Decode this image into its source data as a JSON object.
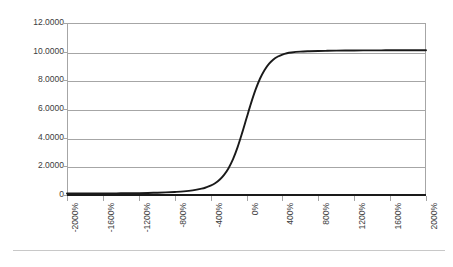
{
  "chart_data": {
    "type": "line",
    "title": "",
    "subtitle": "",
    "xlabel": "",
    "ylabel": "",
    "grid": true,
    "legend": false,
    "legend_position": "none",
    "xlim": [
      -2000,
      2000
    ],
    "ylim": [
      0,
      12
    ],
    "x_tick_labels": [
      "-2000%",
      "-1600%",
      "-1200%",
      "-800%",
      "-400%",
      "0%",
      "400%",
      "800%",
      "1200%",
      "1600%",
      "2000%"
    ],
    "x_tick_values": [
      -2000,
      -1600,
      -1200,
      -800,
      -400,
      0,
      400,
      800,
      1200,
      1600,
      2000
    ],
    "y_tick_labels": [
      "0",
      "2.0000",
      "4.0000",
      "6.0000",
      "8.0000",
      "10.0000",
      "12.0000"
    ],
    "y_tick_values": [
      0,
      2,
      4,
      6,
      8,
      10,
      12
    ],
    "series": [
      {
        "name": "logistic-curve",
        "color": "#1a1a1a",
        "x": [
          -2000,
          -1900,
          -1800,
          -1700,
          -1600,
          -1500,
          -1400,
          -1300,
          -1200,
          -1100,
          -1000,
          -900,
          -800,
          -700,
          -600,
          -500,
          -450,
          -400,
          -350,
          -300,
          -250,
          -200,
          -150,
          -100,
          -50,
          0,
          50,
          100,
          150,
          200,
          250,
          300,
          350,
          400,
          450,
          500,
          600,
          700,
          800,
          900,
          1000,
          1100,
          1200,
          1300,
          1400,
          1500,
          1600,
          1700,
          1800,
          1900,
          2000
        ],
        "y": [
          0.1,
          0.1,
          0.1,
          0.1,
          0.11,
          0.11,
          0.12,
          0.12,
          0.13,
          0.14,
          0.16,
          0.18,
          0.21,
          0.25,
          0.32,
          0.44,
          0.53,
          0.65,
          0.82,
          1.06,
          1.4,
          1.87,
          2.5,
          3.32,
          4.3,
          5.35,
          6.39,
          7.33,
          8.11,
          8.71,
          9.15,
          9.46,
          9.66,
          9.8,
          9.89,
          9.94,
          10.0,
          10.03,
          10.05,
          10.06,
          10.07,
          10.08,
          10.08,
          10.09,
          10.09,
          10.09,
          10.1,
          10.1,
          10.1,
          10.1,
          10.1
        ]
      }
    ]
  },
  "axes": {
    "y_axis_name": "value-axis",
    "x_axis_name": "percent-axis"
  }
}
